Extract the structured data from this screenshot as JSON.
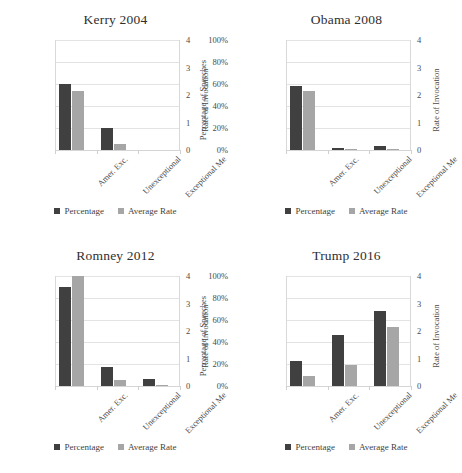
{
  "figure": {
    "panels": [
      "kerry",
      "obama",
      "romney",
      "trump"
    ],
    "legend": {
      "percentage": "Percentage",
      "average_rate": "Average Rate"
    },
    "colors": {
      "percentage": "#404040",
      "average_rate": "#a6a6a6",
      "gridline": "#e3e3e3"
    },
    "bleed_text": ""
  },
  "chart_data": [
    {
      "type": "bar",
      "title": "Kerry 2004",
      "categories": [
        "Amer. Exc.",
        "Unexceptional",
        "Exceptional Me"
      ],
      "series": [
        {
          "name": "Percentage",
          "values": [
            60,
            20,
            0
          ],
          "axis": "left"
        },
        {
          "name": "Average Rate",
          "values": [
            2.15,
            0.22,
            0
          ],
          "axis": "right"
        }
      ],
      "xlabel": "",
      "ylabel": "Percentage of Speeches",
      "y2label": "Rate of Invocation",
      "yticks": [
        "0%",
        "20%",
        "40%",
        "60%",
        "80%",
        "100%"
      ],
      "y2ticks": [
        "0",
        "1",
        "2",
        "3",
        "4"
      ],
      "ylim": [
        0,
        100
      ],
      "y2lim": [
        0,
        4
      ],
      "grid": true,
      "legend_position": "bottom"
    },
    {
      "type": "bar",
      "title": "Obama 2008",
      "categories": [
        "Amer. Exc.",
        "Unexceptional",
        "Exceptional Me"
      ],
      "series": [
        {
          "name": "Percentage",
          "values": [
            58,
            2,
            4
          ],
          "axis": "left"
        },
        {
          "name": "Average Rate",
          "values": [
            2.15,
            0.05,
            0.05
          ],
          "axis": "right"
        }
      ],
      "xlabel": "",
      "ylabel": "Percentage of Speeches",
      "y2label": "Rate of Invocation",
      "yticks": [
        "0%",
        "20%",
        "40%",
        "60%",
        "80%",
        "100%"
      ],
      "y2ticks": [
        "0",
        "1",
        "2",
        "3",
        "4"
      ],
      "ylim": [
        0,
        100
      ],
      "y2lim": [
        0,
        4
      ],
      "grid": true,
      "legend_position": "bottom"
    },
    {
      "type": "bar",
      "title": "Romney 2012",
      "categories": [
        "Amer. Exc.",
        "Unexceptional",
        "Exceptional Me"
      ],
      "series": [
        {
          "name": "Percentage",
          "values": [
            90,
            17,
            6
          ],
          "axis": "left"
        },
        {
          "name": "Average Rate",
          "values": [
            4.0,
            0.22,
            0.05
          ],
          "axis": "right"
        }
      ],
      "xlabel": "",
      "ylabel": "Percentage of Speeches",
      "y2label": "Rate of Invocation",
      "yticks": [
        "0%",
        "20%",
        "40%",
        "60%",
        "80%",
        "100%"
      ],
      "y2ticks": [
        "0",
        "1",
        "2",
        "3",
        "4"
      ],
      "ylim": [
        0,
        100
      ],
      "y2lim": [
        0,
        4
      ],
      "grid": true,
      "legend_position": "bottom"
    },
    {
      "type": "bar",
      "title": "Trump 2016",
      "categories": [
        "Amer. Exc.",
        "Unexceptional",
        "Exceptional Me"
      ],
      "series": [
        {
          "name": "Percentage",
          "values": [
            23,
            46,
            68
          ],
          "axis": "left"
        },
        {
          "name": "Average Rate",
          "values": [
            0.38,
            0.78,
            2.15
          ],
          "axis": "right"
        }
      ],
      "xlabel": "",
      "ylabel": "Percentage of Speeches",
      "y2label": "Rate of Invocation",
      "yticks": [
        "0%",
        "20%",
        "40%",
        "60%",
        "80%",
        "100%"
      ],
      "y2ticks": [
        "0",
        "1",
        "2",
        "3",
        "4"
      ],
      "ylim": [
        0,
        100
      ],
      "y2lim": [
        0,
        4
      ],
      "grid": true,
      "legend_position": "bottom"
    }
  ]
}
